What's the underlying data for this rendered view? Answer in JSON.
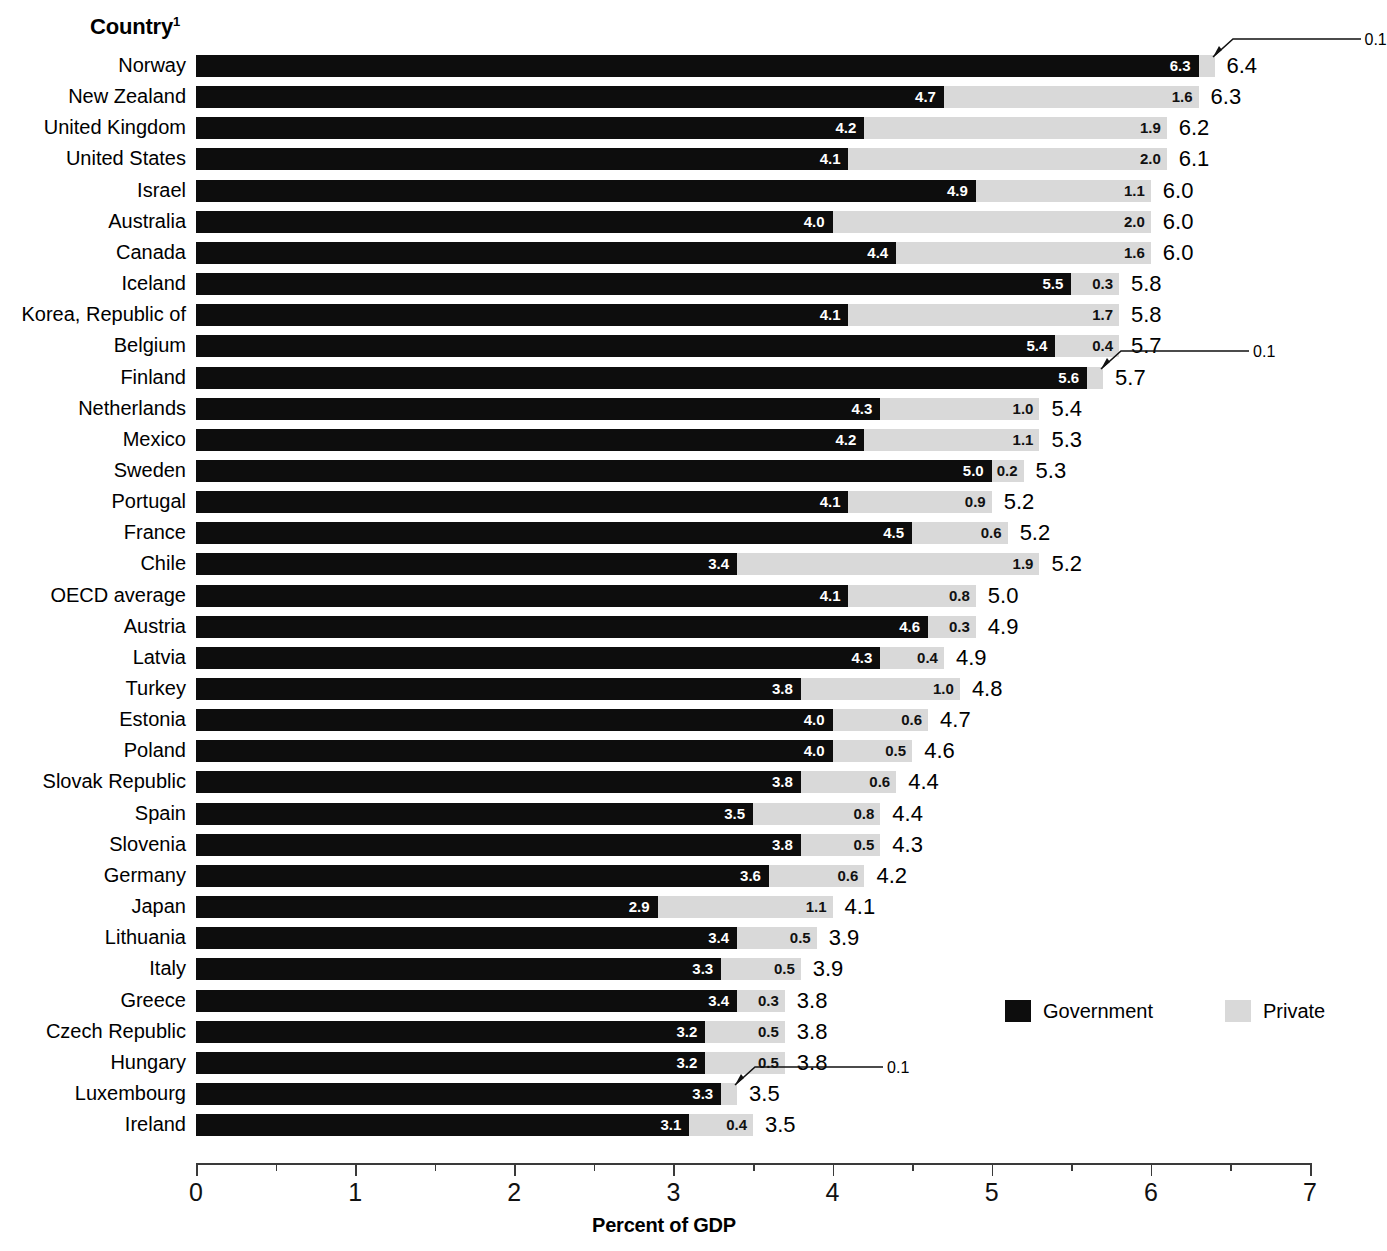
{
  "header": {
    "column_title": "Country",
    "column_title_footnote": "1"
  },
  "legend": {
    "position": "bottom-right",
    "items": [
      {
        "label": "Government",
        "color": "#0d0d0d",
        "swatch": "legend-swatch-government"
      },
      {
        "label": "Private",
        "color": "#d9d9d9",
        "swatch": "legend-swatch-private"
      }
    ]
  },
  "axis": {
    "title": "Percent of GDP",
    "ticks": [
      "0",
      "1",
      "2",
      "3",
      "4",
      "5",
      "6",
      "7"
    ],
    "min": 0,
    "max": 7
  },
  "chart_data": {
    "type": "bar",
    "orientation": "horizontal",
    "stacked": true,
    "title": "",
    "subtitle": "",
    "xlabel": "Percent of GDP",
    "ylabel": "Country",
    "xlim": [
      0,
      7
    ],
    "grid": false,
    "legend_position": "bottom-right",
    "categories": [
      "Norway",
      "New Zealand",
      "United Kingdom",
      "United States",
      "Israel",
      "Australia",
      "Canada",
      "Iceland",
      "Korea, Republic of",
      "Belgium",
      "Finland",
      "Netherlands",
      "Mexico",
      "Sweden",
      "Portugal",
      "France",
      "Chile",
      "OECD average",
      "Austria",
      "Latvia",
      "Turkey",
      "Estonia",
      "Poland",
      "Slovak Republic",
      "Spain",
      "Slovenia",
      "Germany",
      "Japan",
      "Lithuania",
      "Italy",
      "Greece",
      "Czech Republic",
      "Hungary",
      "Luxembourg",
      "Ireland"
    ],
    "series": [
      {
        "name": "Government",
        "color": "#0d0d0d",
        "values": [
          6.3,
          4.7,
          4.2,
          4.1,
          4.9,
          4.0,
          4.4,
          5.5,
          4.1,
          5.4,
          5.6,
          4.3,
          4.2,
          5.0,
          4.1,
          4.5,
          3.4,
          4.1,
          4.6,
          4.3,
          3.8,
          4.0,
          4.0,
          3.8,
          3.5,
          3.8,
          3.6,
          2.9,
          3.4,
          3.3,
          3.4,
          3.2,
          3.2,
          3.3,
          3.1
        ]
      },
      {
        "name": "Private",
        "color": "#d9d9d9",
        "values": [
          0.1,
          1.6,
          1.9,
          2.0,
          1.1,
          2.0,
          1.6,
          0.3,
          1.7,
          0.4,
          0.1,
          1.0,
          1.1,
          0.2,
          0.9,
          0.6,
          1.9,
          0.8,
          0.3,
          0.4,
          1.0,
          0.6,
          0.5,
          0.6,
          0.8,
          0.5,
          0.6,
          1.1,
          0.5,
          0.5,
          0.3,
          0.5,
          0.5,
          0.1,
          0.4
        ]
      }
    ],
    "totals": [
      6.4,
      6.3,
      6.2,
      6.1,
      6.0,
      6.0,
      6.0,
      5.8,
      5.8,
      5.7,
      5.7,
      5.4,
      5.3,
      5.3,
      5.2,
      5.2,
      5.2,
      5.0,
      4.9,
      4.9,
      4.8,
      4.7,
      4.6,
      4.4,
      4.4,
      4.3,
      4.2,
      4.1,
      3.9,
      3.9,
      3.8,
      3.8,
      3.8,
      3.5,
      3.5
    ],
    "gov_labels": [
      "6.3",
      "4.7",
      "4.2",
      "4.1",
      "4.9",
      "4.0",
      "4.4",
      "5.5",
      "4.1",
      "5.4",
      "5.6",
      "4.3",
      "4.2",
      "5.0",
      "4.1",
      "4.5",
      "3.4",
      "4.1",
      "4.6",
      "4.3",
      "3.8",
      "4.0",
      "4.0",
      "3.8",
      "3.5",
      "3.8",
      "3.6",
      "2.9",
      "3.4",
      "3.3",
      "3.4",
      "3.2",
      "3.2",
      "3.3",
      "3.1"
    ],
    "private_labels": [
      "0.1",
      "1.6",
      "1.9",
      "2.0",
      "1.1",
      "2.0",
      "1.6",
      "0.3",
      "1.7",
      "0.4",
      "0.1",
      "1.0",
      "1.1",
      "0.2",
      "0.9",
      "0.6",
      "1.9",
      "0.8",
      "0.3",
      "0.4",
      "1.0",
      "0.6",
      "0.5",
      "0.6",
      "0.8",
      "0.5",
      "0.6",
      "1.1",
      "0.5",
      "0.5",
      "0.3",
      "0.5",
      "0.5",
      "0.1",
      "0.4"
    ],
    "total_labels": [
      "6.4",
      "6.3",
      "6.2",
      "6.1",
      "6.0",
      "6.0",
      "6.0",
      "5.8",
      "5.8",
      "5.7",
      "5.7",
      "5.4",
      "5.3",
      "5.3",
      "5.2",
      "5.2",
      "5.2",
      "5.0",
      "4.9",
      "4.9",
      "4.8",
      "4.7",
      "4.6",
      "4.4",
      "4.4",
      "4.3",
      "4.2",
      "4.1",
      "3.9",
      "3.9",
      "3.8",
      "3.8",
      "3.8",
      "3.5",
      "3.5"
    ],
    "callout_rows": [
      0,
      10,
      33
    ],
    "annotations": [
      {
        "row": 0,
        "country": "Norway",
        "value": "0.1",
        "note": "leader line from private segment"
      },
      {
        "row": 10,
        "country": "Finland",
        "value": "0.1",
        "note": "leader line from private segment"
      },
      {
        "row": 33,
        "country": "Luxembourg",
        "value": "0.1",
        "note": "leader line from private segment"
      }
    ]
  }
}
